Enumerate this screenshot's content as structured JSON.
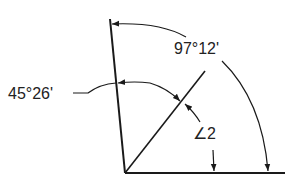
{
  "diagram": {
    "labels": {
      "large_angle": "97°12'",
      "small_angle": "45°26'",
      "angle_two": "∠2"
    },
    "colors": {
      "line": "#1a1a1a",
      "background": "#ffffff"
    }
  }
}
